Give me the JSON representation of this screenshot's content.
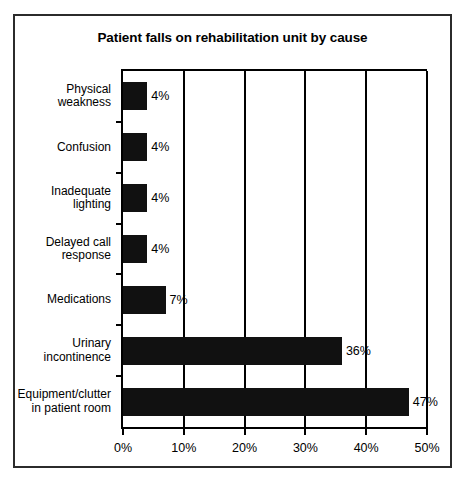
{
  "chart_data": {
    "type": "bar",
    "orientation": "horizontal",
    "title": "Patient falls on rehabilitation unit by cause",
    "xlabel": "",
    "ylabel": "",
    "xlim": [
      0,
      50
    ],
    "xticks": [
      "0%",
      "10%",
      "20%",
      "30%",
      "40%",
      "50%"
    ],
    "xtick_values": [
      0,
      10,
      20,
      30,
      40,
      50
    ],
    "grid": true,
    "legend": null,
    "bar_color": "#111111",
    "categories": [
      "Physical\nweakness",
      "Confusion",
      "Inadequate\nlighting",
      "Delayed call\nresponse",
      "Medications",
      "Urinary\nincontinence",
      "Equipment/clutter\nin patient room"
    ],
    "values": [
      4,
      4,
      4,
      4,
      7,
      36,
      47
    ],
    "value_labels": [
      "4%",
      "4%",
      "4%",
      "4%",
      "7%",
      "36%",
      "47%"
    ]
  }
}
